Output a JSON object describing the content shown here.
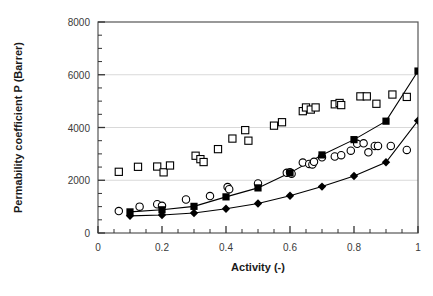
{
  "chart_data": {
    "type": "scatter",
    "title": "",
    "xlabel": "Activity (-)",
    "ylabel": "Permability coefficient P (Barrer)",
    "xlim": [
      0,
      1
    ],
    "ylim": [
      0,
      8000
    ],
    "xticks": [
      0,
      0.2,
      0.4,
      0.6,
      0.8,
      1
    ],
    "xtick_labels": [
      "0",
      "0.2",
      "0.4",
      "0.6",
      "0.8",
      "1"
    ],
    "yticks": [
      0,
      2000,
      4000,
      6000,
      8000
    ],
    "ytick_labels": [
      "0",
      "2000",
      "4000",
      "6000",
      "8000"
    ],
    "x_minor_tick_step": 0.05,
    "y_minor_tick_step": 500,
    "grid": "horizontal-major",
    "grid_color": "#d9d9d9",
    "legend": "none",
    "frame": "full-box",
    "marker_color": "#000000",
    "line_color": "#000000",
    "series": [
      {
        "name": "open-squares",
        "marker": "open-square",
        "line": false,
        "points": [
          [
            0.065,
            2320
          ],
          [
            0.125,
            2510
          ],
          [
            0.185,
            2520
          ],
          [
            0.205,
            2300
          ],
          [
            0.225,
            2560
          ],
          [
            0.305,
            2930
          ],
          [
            0.32,
            2800
          ],
          [
            0.33,
            2690
          ],
          [
            0.375,
            3180
          ],
          [
            0.42,
            3580
          ],
          [
            0.46,
            3900
          ],
          [
            0.47,
            3500
          ],
          [
            0.55,
            4070
          ],
          [
            0.575,
            4200
          ],
          [
            0.64,
            4620
          ],
          [
            0.65,
            4760
          ],
          [
            0.665,
            4680
          ],
          [
            0.68,
            4760
          ],
          [
            0.74,
            4880
          ],
          [
            0.755,
            4930
          ],
          [
            0.76,
            4850
          ],
          [
            0.82,
            5180
          ],
          [
            0.84,
            5180
          ],
          [
            0.87,
            4900
          ],
          [
            0.92,
            5250
          ],
          [
            0.965,
            5160
          ]
        ]
      },
      {
        "name": "open-circles",
        "marker": "open-circle",
        "line": false,
        "points": [
          [
            0.065,
            830
          ],
          [
            0.13,
            1000
          ],
          [
            0.185,
            1090
          ],
          [
            0.2,
            1030
          ],
          [
            0.275,
            1270
          ],
          [
            0.35,
            1400
          ],
          [
            0.405,
            1740
          ],
          [
            0.41,
            1660
          ],
          [
            0.5,
            1880
          ],
          [
            0.59,
            2280
          ],
          [
            0.6,
            2300
          ],
          [
            0.605,
            2250
          ],
          [
            0.64,
            2670
          ],
          [
            0.66,
            2620
          ],
          [
            0.67,
            2600
          ],
          [
            0.675,
            2700
          ],
          [
            0.7,
            2870
          ],
          [
            0.74,
            2900
          ],
          [
            0.76,
            2950
          ],
          [
            0.79,
            3120
          ],
          [
            0.81,
            3380
          ],
          [
            0.83,
            3400
          ],
          [
            0.845,
            3060
          ],
          [
            0.865,
            3300
          ],
          [
            0.875,
            3300
          ],
          [
            0.915,
            3300
          ],
          [
            0.965,
            3150
          ]
        ]
      },
      {
        "name": "filled-squares",
        "marker": "filled-square",
        "line": true,
        "points": [
          [
            0.1,
            800
          ],
          [
            0.2,
            880
          ],
          [
            0.3,
            1010
          ],
          [
            0.4,
            1370
          ],
          [
            0.5,
            1710
          ],
          [
            0.6,
            2280
          ],
          [
            0.7,
            2960
          ],
          [
            0.8,
            3540
          ],
          [
            0.9,
            4240
          ],
          [
            1.0,
            6140
          ]
        ]
      },
      {
        "name": "filled-diamonds",
        "marker": "filled-diamond",
        "line": true,
        "points": [
          [
            0.1,
            650
          ],
          [
            0.2,
            680
          ],
          [
            0.3,
            760
          ],
          [
            0.4,
            920
          ],
          [
            0.5,
            1120
          ],
          [
            0.6,
            1410
          ],
          [
            0.7,
            1760
          ],
          [
            0.8,
            2160
          ],
          [
            0.9,
            2680
          ],
          [
            1.0,
            4260
          ]
        ]
      }
    ]
  }
}
